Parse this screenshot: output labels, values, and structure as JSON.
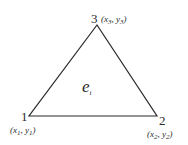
{
  "diagram": {
    "element_label": {
      "main": "e",
      "sub": "i"
    },
    "nodes": [
      {
        "id": "1",
        "label": "1",
        "coord_x": "x",
        "coord_x_sub": "1",
        "coord_y": "y",
        "coord_y_sub": "1",
        "px": 29,
        "py": 116
      },
      {
        "id": "2",
        "label": "2",
        "coord_x": "x",
        "coord_x_sub": "2",
        "coord_y": "y",
        "coord_y_sub": "2",
        "px": 157,
        "py": 116
      },
      {
        "id": "3",
        "label": "3",
        "coord_x": "x",
        "coord_x_sub": "3",
        "coord_y": "y",
        "coord_y_sub": "3",
        "px": 97,
        "py": 25
      }
    ],
    "edges": [
      [
        "1",
        "2"
      ],
      [
        "2",
        "3"
      ],
      [
        "3",
        "1"
      ]
    ],
    "colors": {
      "stroke": "#2a2a2a",
      "background": "#ffffff"
    }
  }
}
